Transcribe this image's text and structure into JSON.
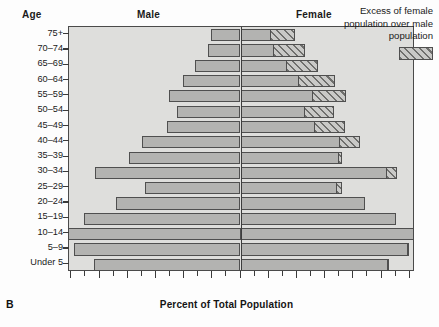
{
  "panel_label": "B",
  "headers": {
    "age": "Age",
    "male": "Male",
    "female": "Female"
  },
  "legend": {
    "line1": "Excess of female",
    "line2": "population over male",
    "line3": "population",
    "swatch_name": "excess-female-hatch"
  },
  "axis": {
    "xtitle": "Percent of Total Population",
    "xticklabels": [
      "12",
      "10",
      "8",
      "6",
      "4",
      "2",
      "0",
      "2",
      "4",
      "6",
      "8",
      "10",
      "12"
    ]
  },
  "colors": {
    "bar_fill": "#b3b3b1",
    "bar_stroke": "#4f4f4f",
    "plot_bg": "#dededc",
    "axis": "#3d3d3d",
    "hatch_dark": "#6f6f6d",
    "hatch_light": "#c9c9c7"
  },
  "chart_data": {
    "type": "bar",
    "subtype": "population-pyramid",
    "title": "",
    "xlabel": "Percent of Total Population",
    "ylabel": "Age",
    "xlim": [
      -13,
      13
    ],
    "xticks": [
      -12,
      -11,
      -10,
      -9,
      -8,
      -7,
      -6,
      -5,
      -4,
      -3,
      -2,
      -1,
      0,
      1,
      2,
      3,
      4,
      5,
      6,
      7,
      8,
      9,
      10,
      11,
      12
    ],
    "xtick_major": [
      -12,
      -10,
      -8,
      -6,
      -4,
      -2,
      0,
      2,
      4,
      6,
      8,
      10,
      12
    ],
    "grid": false,
    "legend_position": "top-right",
    "categories": [
      "75+",
      "70-74",
      "65-69",
      "60-64",
      "55-59",
      "50-54",
      "45-49",
      "40-44",
      "35-39",
      "30-34",
      "25-29",
      "20-24",
      "15-19",
      "10-14",
      "5-9",
      "Under 5"
    ],
    "series": [
      {
        "name": "Male",
        "side": "left",
        "values": [
          2.1,
          2.3,
          3.2,
          4.1,
          5.1,
          4.5,
          5.2,
          7.0,
          7.9,
          10.3,
          6.8,
          8.8,
          11.1,
          12.3,
          11.8,
          10.4
        ]
      },
      {
        "name": "Female",
        "side": "right",
        "values": [
          3.9,
          4.6,
          5.5,
          6.7,
          7.5,
          6.6,
          7.4,
          8.5,
          7.2,
          11.1,
          7.2,
          8.8,
          11.0,
          12.4,
          11.9,
          10.5
        ]
      },
      {
        "name": "Excess of female population over male population",
        "side": "right-overlay",
        "hatched": true,
        "values": [
          1.8,
          2.3,
          2.3,
          2.6,
          2.4,
          2.1,
          2.2,
          1.5,
          0.3,
          0.8,
          0.4,
          0.0,
          0.0,
          0.1,
          0.1,
          0.1
        ]
      }
    ]
  }
}
